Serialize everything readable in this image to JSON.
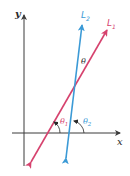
{
  "diagram": {
    "type": "angle-between-lines",
    "colors": {
      "background": "#ffffff",
      "axes": "#3a3a3a",
      "line_L1": "#d6426e",
      "line_L2": "#3b9ad6",
      "text_dark": "#2a2a2a"
    },
    "axes": {
      "x_label": "x",
      "y_label": "y"
    },
    "lines": [
      {
        "id": "L1",
        "label": "L",
        "subscript": "1"
      },
      {
        "id": "L2",
        "label": "L",
        "subscript": "2"
      }
    ],
    "angles": {
      "between": "θ",
      "theta1": {
        "symbol": "θ",
        "subscript": "1"
      },
      "theta2": {
        "symbol": "θ",
        "subscript": "2"
      }
    }
  }
}
